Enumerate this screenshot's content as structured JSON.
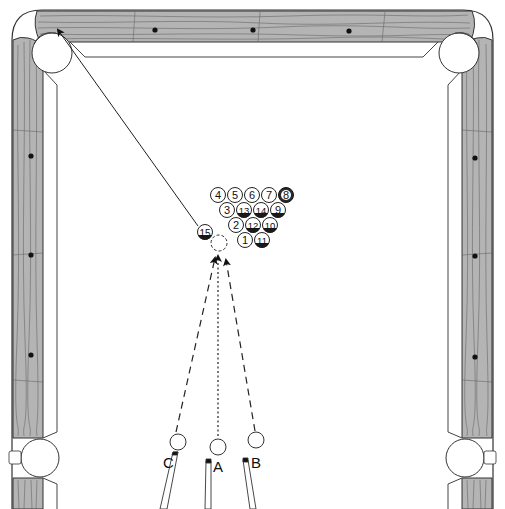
{
  "diagram": {
    "colors": {
      "rail_wood": "#b4b4b4",
      "rail_grain": "#555555",
      "outline": "#333333",
      "cloth": "#ffffff",
      "diamond": "#111111",
      "stripe_band": "#1a1a1a"
    },
    "rack": {
      "rows": [
        [
          "4",
          "5",
          "6",
          "7",
          "8"
        ],
        [
          "3",
          "13",
          "14",
          "9"
        ],
        [
          "2",
          "12",
          "10"
        ],
        [
          "1",
          "11"
        ]
      ]
    },
    "object_ball": {
      "label": "15"
    },
    "cue_positions": [
      {
        "label": "C"
      },
      {
        "label": "A"
      },
      {
        "label": "B"
      }
    ],
    "pockets": [
      "top-left-corner",
      "top-right-corner",
      "left-side",
      "right-side"
    ],
    "diamonds": {
      "top": 3,
      "left": 3,
      "right": 3
    }
  }
}
